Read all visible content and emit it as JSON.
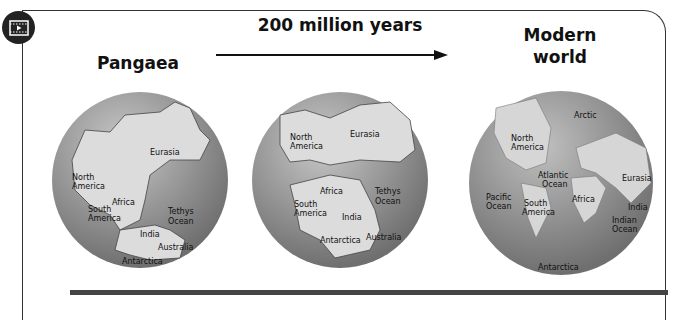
{
  "header": {
    "media_icon": "film-play-icon",
    "timespan_label": "200 million years"
  },
  "panels": [
    {
      "title": "Pangaea",
      "labels": [
        "Eurasia",
        "North",
        "America",
        "Africa",
        "South",
        "America",
        "Tethys",
        "Ocean",
        "India",
        "Australia",
        "Antarctica"
      ]
    },
    {
      "title": "",
      "labels": [
        "North",
        "America",
        "Eurasia",
        "Africa",
        "Tethys",
        "Ocean",
        "South",
        "America",
        "India",
        "Antarctica",
        "Australia"
      ]
    },
    {
      "title_line1": "Modern",
      "title_line2": "world",
      "labels": [
        "Arctic",
        "North",
        "America",
        "Atlantic",
        "Ocean",
        "Eurasia",
        "Pacific",
        "Ocean",
        "Africa",
        "South",
        "America",
        "India",
        "Indian",
        "Ocean",
        "Antarctica"
      ]
    }
  ],
  "colors": {
    "ocean": "#8a8a8a",
    "land": "#d9d9d9",
    "frame": "#333333"
  }
}
